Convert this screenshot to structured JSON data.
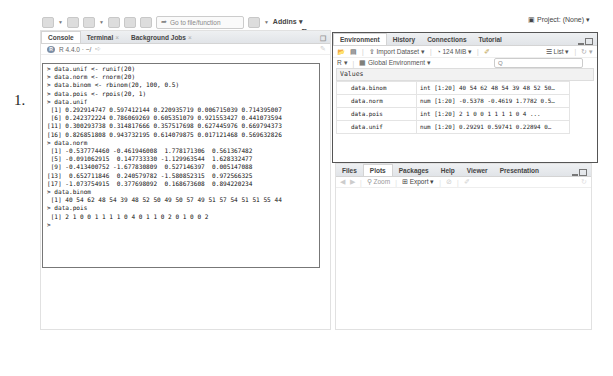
{
  "toolbar": {
    "goto_placeholder": "Go to file/function",
    "addins_label": "Addins",
    "project_label": "Project: (None)"
  },
  "annotations": {
    "label_1": "1.",
    "label_2": "2."
  },
  "console_pane": {
    "tabs": [
      {
        "label": "Console",
        "active": true
      },
      {
        "label": "Terminal",
        "active": false,
        "closable": true
      },
      {
        "label": "Background Jobs",
        "active": false,
        "closable": true
      }
    ],
    "r_version": "R 4.4.0 · ~/",
    "lines": [
      "> data.unif <- runif(20)",
      "> data.norm <- rnorm(20)",
      "> data.binom <- rbinom(20, 100, 0.5)",
      "> data.pois <- rpois(20, 1)",
      "> data.unif",
      " [1] 0.292914747 0.597412144 0.220935719 0.006715039 0.714395007",
      " [6] 0.242372224 0.786069269 0.605351079 0.921553427 0.441073594",
      "[11] 0.300293738 0.314817666 0.357517698 0.627445976 0.669794373",
      "[16] 0.826851808 0.943732195 0.614079875 0.017121468 0.569632826",
      "> data.norm",
      " [1] -0.537774460 -0.461946008  1.778171306  0.561367482",
      " [5] -0.091062915  0.147733330 -1.129963544  1.628332477",
      " [9] -0.413400752 -1.677830809  0.527146397  0.005147088",
      "[13]  0.652711846  0.240579782 -1.580852315  0.972566325",
      "[17] -1.073754915  0.377698092  0.168673608  0.894220234",
      "> data.binom",
      " [1] 40 54 62 48 54 39 48 52 50 49 50 57 49 51 57 54 51 51 55 44",
      "> data.pois",
      " [1] 2 1 0 0 1 1 1 1 0 4 0 1 1 0 2 0 1 0 0 2",
      "> "
    ]
  },
  "env_pane": {
    "tabs": [
      {
        "label": "Environment",
        "active": true
      },
      {
        "label": "History",
        "active": false
      },
      {
        "label": "Connections",
        "active": false
      },
      {
        "label": "Tutorial",
        "active": false
      }
    ],
    "import_label": "Import Dataset",
    "memory_label": "124 MiB",
    "list_label": "List",
    "lang_label": "R",
    "env_label": "Global Environment",
    "search_placeholder": "Q",
    "section_label": "Values",
    "rows": [
      {
        "name": "data.binom",
        "value": "int [1:20] 40 54 62 48 54 39 48 52 50…"
      },
      {
        "name": "data.norm",
        "value": "num [1:20] -0.5378 -0.4619 1.7782 0.5…"
      },
      {
        "name": "data.pois",
        "value": "int [1:20] 2 1 0 0 1 1 1 1 0 4 ..."
      },
      {
        "name": "data.unif",
        "value": "num [1:20] 0.29291 0.59741 0.22894 0…"
      }
    ]
  },
  "plots_pane": {
    "tabs": [
      {
        "label": "Files",
        "active": false
      },
      {
        "label": "Plots",
        "active": true
      },
      {
        "label": "Packages",
        "active": false
      },
      {
        "label": "Help",
        "active": false
      },
      {
        "label": "Viewer",
        "active": false
      },
      {
        "label": "Presentation",
        "active": false
      }
    ],
    "zoom_label": "Zoom",
    "export_label": "Export"
  }
}
